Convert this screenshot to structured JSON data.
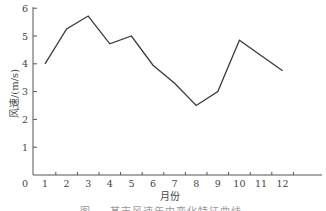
{
  "chart_data": {
    "type": "line",
    "title": "",
    "xlabel": "月份",
    "ylabel": "风速/(m/s)",
    "categories": [
      "1",
      "2",
      "3",
      "4",
      "5",
      "6",
      "7",
      "8",
      "9",
      "10",
      "11",
      "12"
    ],
    "x": [
      1,
      2,
      3,
      4,
      5,
      6,
      7,
      8,
      9,
      10,
      11,
      12
    ],
    "series": [
      {
        "name": "风速",
        "values": [
          4.0,
          5.25,
          5.72,
          4.72,
          5.0,
          3.95,
          3.3,
          2.5,
          3.0,
          4.85,
          4.3,
          3.75
        ]
      }
    ],
    "yticks": [
      "1",
      "2",
      "3",
      "4",
      "5",
      "6"
    ],
    "origin_label": "0",
    "ylim": [
      0,
      6
    ],
    "xlim": [
      0,
      13
    ],
    "grid": false,
    "legend": null
  },
  "caption": "图 … 某市风速年内变化特征曲线",
  "colors": {
    "line": "#3a3a3a",
    "axis": "#555555"
  }
}
